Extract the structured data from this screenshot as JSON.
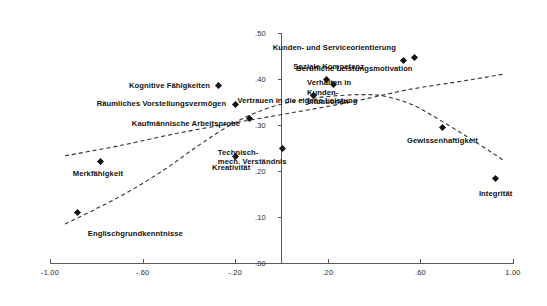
{
  "chart_data": {
    "type": "scatter",
    "title": "",
    "subtitle": "",
    "xlabel": "",
    "ylabel": "",
    "xlim": [
      -1.0,
      1.0
    ],
    "ylim": [
      0.0,
      0.5
    ],
    "grid": false,
    "legend": "none",
    "xticks": [
      "-1.00",
      "-.60",
      "-.20",
      ".20",
      ".60",
      "1.00"
    ],
    "xtick_values": [
      -1.0,
      -0.6,
      -0.2,
      0.2,
      0.6,
      1.0
    ],
    "yticks": [
      ".00",
      ".10",
      ".20",
      ".30",
      ".40",
      ".50"
    ],
    "ytick_values": [
      0.0,
      0.1,
      0.2,
      0.3,
      0.4,
      0.5
    ],
    "points": [
      {
        "label": "Englischgrundkenntnisse",
        "x": -0.88,
        "y": 0.11,
        "label_anchor": "left",
        "label_dx": 10,
        "label_dy": 22
      },
      {
        "label": "Merkfähigkeit",
        "x": -0.78,
        "y": 0.22,
        "label_anchor": "center",
        "label_dx": -3,
        "label_dy": 12
      },
      {
        "label": "Kognitive Fähigkeiten",
        "x": -0.27,
        "y": 0.385,
        "label_anchor": "right",
        "label_dx": -9,
        "label_dy": 0
      },
      {
        "label": "Räumliches Vorstellungsvermögen",
        "x": -0.2,
        "y": 0.345,
        "label_anchor": "right",
        "label_dx": -9,
        "label_dy": 0
      },
      {
        "label": "Kaufmännische Arbeitsprobe",
        "x": -0.14,
        "y": 0.315,
        "label_anchor": "right",
        "label_dx": -9,
        "label_dy": 6
      },
      {
        "label": "Kreativität",
        "x": -0.2,
        "y": 0.232,
        "label_anchor": "center",
        "label_dx": -4,
        "label_dy": 12
      },
      {
        "label": "Technisch-\nmech. Verständnis",
        "x": 0.005,
        "y": 0.248,
        "label_anchor": "right",
        "label_dx": 4,
        "label_dy": 8
      },
      {
        "label": "Verhalten in\nKunden-\nsituationen",
        "x": 0.14,
        "y": 0.365,
        "label_anchor": "left",
        "label_dx": -7,
        "label_dy": -3
      },
      {
        "label": "Soziale Kompetenz",
        "x": 0.195,
        "y": 0.398,
        "label_anchor": "center",
        "label_dx": 2,
        "label_dy": -13
      },
      {
        "label": "Vertrauen in die eigene Leistung",
        "x": 0.225,
        "y": 0.387,
        "label_anchor": "right",
        "label_dx": 24,
        "label_dy": 16
      },
      {
        "label": "Kunden- und Serviceorientierung",
        "x": 0.525,
        "y": 0.44,
        "label_anchor": "right",
        "label_dx": -7,
        "label_dy": -13
      },
      {
        "label": "Berufliche Leistungsmotivation",
        "x": 0.575,
        "y": 0.447,
        "label_anchor": "right",
        "label_dx": -2,
        "label_dy": 12
      },
      {
        "label": "Gewissenhaftigkeit",
        "x": 0.695,
        "y": 0.295,
        "label_anchor": "center",
        "label_dx": 0,
        "label_dy": 14
      },
      {
        "label": "Integrität",
        "x": 0.925,
        "y": 0.183,
        "label_anchor": "center",
        "label_dx": 0,
        "label_dy": 15
      }
    ],
    "curves": [
      {
        "name": "rising-steep-curve",
        "style": "dashed",
        "points": [
          [
            -0.935,
            0.085
          ],
          [
            -0.8,
            0.118
          ],
          [
            -0.65,
            0.158
          ],
          [
            -0.5,
            0.205
          ],
          [
            -0.36,
            0.255
          ],
          [
            -0.22,
            0.3
          ],
          [
            -0.08,
            0.333
          ],
          [
            0.06,
            0.352
          ],
          [
            0.2,
            0.362
          ],
          [
            0.34,
            0.366
          ],
          [
            0.44,
            0.363
          ],
          [
            0.56,
            0.345
          ],
          [
            0.68,
            0.312
          ],
          [
            0.8,
            0.275
          ],
          [
            0.9,
            0.243
          ],
          [
            0.965,
            0.221
          ]
        ]
      },
      {
        "name": "rising-shallow-curve",
        "style": "dashed",
        "points": [
          [
            -0.935,
            0.233
          ],
          [
            -0.7,
            0.255
          ],
          [
            -0.45,
            0.282
          ],
          [
            -0.2,
            0.305
          ],
          [
            0.05,
            0.327
          ],
          [
            0.3,
            0.35
          ],
          [
            0.55,
            0.377
          ],
          [
            0.8,
            0.397
          ],
          [
            0.965,
            0.411
          ]
        ]
      }
    ],
    "colors": {
      "point": "#111111",
      "axis": "#5a5a58",
      "curve": "#333333",
      "text": "#111111",
      "background": "#ffffff"
    }
  }
}
